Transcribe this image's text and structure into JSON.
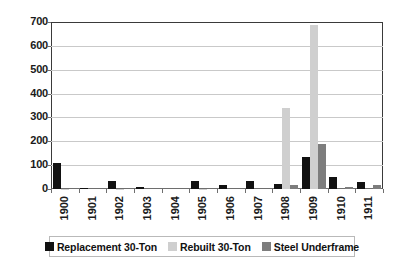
{
  "chart_data": {
    "type": "bar",
    "title": "",
    "xlabel": "",
    "ylabel": "",
    "ylim": [
      0,
      700
    ],
    "yticks": [
      0,
      100,
      200,
      300,
      400,
      500,
      600,
      700
    ],
    "grid": true,
    "legend_position": "bottom",
    "categories": [
      "1900",
      "1901",
      "1902",
      "1903",
      "1904",
      "1905",
      "1906",
      "1907",
      "1908",
      "1909",
      "1910",
      "1911"
    ],
    "series": [
      {
        "name": "Replacement 30-Ton",
        "color": "#111111",
        "values": [
          107,
          3,
          35,
          8,
          0,
          34,
          15,
          33,
          22,
          133,
          50,
          31
        ]
      },
      {
        "name": "Rebuilt 30-Ton",
        "color": "#cfcfcf",
        "values": [
          2,
          0,
          2,
          0,
          0,
          2,
          0,
          0,
          340,
          688,
          0,
          0
        ]
      },
      {
        "name": "Steel Underframe",
        "color": "#7d7d7d",
        "values": [
          0,
          0,
          0,
          0,
          0,
          0,
          0,
          0,
          18,
          190,
          9,
          16
        ]
      }
    ]
  },
  "legend": {
    "items": [
      {
        "label": "Replacement 30-Ton",
        "swatch": "#111111"
      },
      {
        "label": "Rebuilt 30-Ton",
        "swatch": "#cfcfcf"
      },
      {
        "label": "Steel Underframe",
        "swatch": "#7d7d7d"
      }
    ]
  },
  "colors": {
    "axis": "#3a3a3a",
    "gridline": "#c9c9c9",
    "text": "#1a1a1a",
    "background": "#ffffff"
  }
}
